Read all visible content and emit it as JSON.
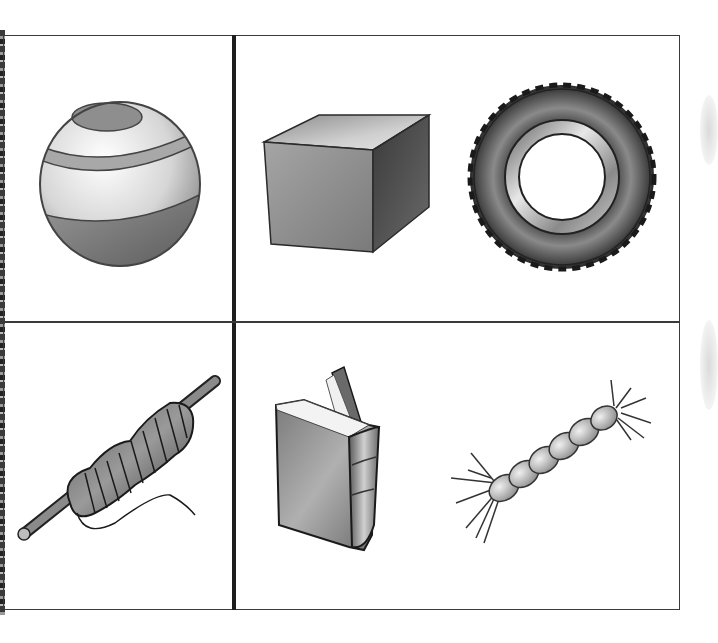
{
  "worksheet": {
    "layout": "2x2 grid of picture cells",
    "cells": [
      {
        "position": "top-left",
        "items": [
          {
            "name": "ball",
            "icon": "striped-ball-icon"
          }
        ]
      },
      {
        "position": "top-right",
        "items": [
          {
            "name": "box",
            "icon": "cube-icon"
          },
          {
            "name": "tire",
            "icon": "tire-icon"
          }
        ]
      },
      {
        "position": "bottom-left",
        "items": [
          {
            "name": "spool of thread",
            "icon": "thread-spool-icon"
          }
        ]
      },
      {
        "position": "bottom-right",
        "items": [
          {
            "name": "book",
            "icon": "book-icon"
          },
          {
            "name": "rope",
            "icon": "rope-icon"
          }
        ]
      }
    ],
    "colors": {
      "border": "#3a3a3a",
      "divider": "#1e1e1e",
      "background": "#ffffff"
    }
  }
}
